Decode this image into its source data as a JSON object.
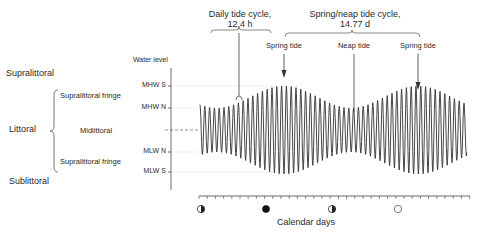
{
  "chart_data": {
    "type": "line",
    "ylabel": "Water level",
    "xlabel": "Calendar days",
    "y_levels": [
      {
        "label": "MHW S",
        "y": 86
      },
      {
        "label": "MHW N",
        "y": 108
      },
      {
        "label": "MLW N",
        "y": 152
      },
      {
        "label": "MLW S",
        "y": 172
      }
    ],
    "mean_level_y": 130,
    "waveform": {
      "x_start": 200,
      "x_end": 467,
      "period_px": 4.8,
      "neap_amplitude": 22,
      "spring_amplitude": 44,
      "spring_x": [
        284,
        418
      ],
      "neap_x": [
        200,
        354
      ]
    },
    "annotations": [
      {
        "text": "Daily tide cycle, 12.4 h",
        "cycle_hours": 12.4
      },
      {
        "text": "Spring/neap tide cycle, 14.77 d",
        "cycle_days": 14.77
      },
      {
        "text": "Spring tide"
      },
      {
        "text": "Neap tide"
      },
      {
        "text": "Spring tide"
      }
    ],
    "moon_phases": [
      {
        "phase": "first-quarter",
        "x": 201
      },
      {
        "phase": "new-moon",
        "x": 266
      },
      {
        "phase": "last-quarter",
        "x": 332
      },
      {
        "phase": "full-moon",
        "x": 398
      }
    ]
  },
  "zones": {
    "supralittoral": "Supralittoral",
    "littoral": "Littoral",
    "sublittoral": "Sublittoral",
    "upper_fringe": "Supralittoral fringe",
    "midlittoral": "Midlittoral",
    "lower_fringe": "Supralittoral fringe"
  },
  "axis": {
    "water_level": "Water level",
    "mhws": "MHW S",
    "mhwn": "MHW N",
    "mlwn": "MLW N",
    "mlws": "MLW S",
    "calendar_days": "Calendar days"
  },
  "top": {
    "daily_line1": "Daily tide cycle,",
    "daily_line2": "12.4 h",
    "springneap_line1": "Spring/neap tide cycle,",
    "springneap_line2": "14.77 d",
    "spring_tide_1": "Spring tide",
    "neap_tide": "Neap tide",
    "spring_tide_2": "Spring tide"
  },
  "colors": {
    "ink": "#2a2a2a",
    "guide": "#bdbdbd",
    "wave": "#333333"
  }
}
